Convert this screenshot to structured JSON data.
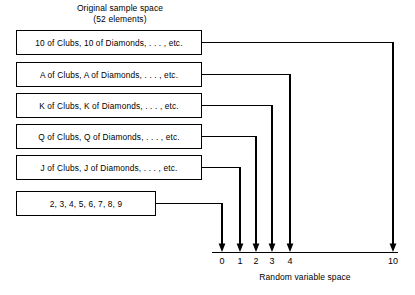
{
  "diagram": {
    "type": "mapping-diagram",
    "heading": {
      "line1": "Original sample space",
      "line2": "(52 elements)"
    },
    "axis_caption": "Random variable space",
    "boxes": [
      {
        "id": "box-10",
        "label": "10 of Clubs, 10 of Diamonds, . . . , etc.",
        "maps_to": "10"
      },
      {
        "id": "box-a",
        "label": "A of Clubs, A of Diamonds, . . . , etc.",
        "maps_to": "4"
      },
      {
        "id": "box-k",
        "label": "K of Clubs, K of Diamonds, . . . , etc.",
        "maps_to": "3"
      },
      {
        "id": "box-q",
        "label": "Q of Clubs, Q of Diamonds, . . . , etc.",
        "maps_to": "2"
      },
      {
        "id": "box-j",
        "label": "J of Clubs, J of Diamonds, . . . , etc.",
        "maps_to": "1"
      },
      {
        "id": "box-num",
        "label": "2, 3, 4, 5, 6, 7, 8, 9",
        "maps_to": "0"
      }
    ],
    "axis": {
      "ticks": [
        "0",
        "1",
        "2",
        "3",
        "4",
        "10"
      ]
    },
    "colors": {
      "stroke": "#000000",
      "background": "#ffffff",
      "text": "#000000"
    }
  }
}
